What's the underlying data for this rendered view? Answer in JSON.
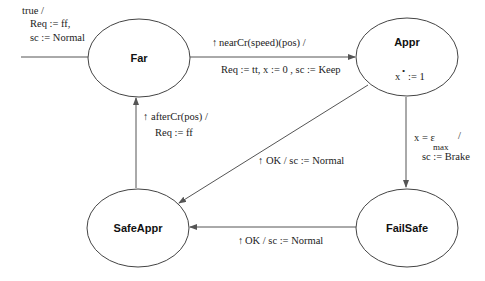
{
  "diagram": {
    "type": "state-machine",
    "states": [
      {
        "id": "far",
        "label": "Far",
        "cx": 139,
        "cy": 58,
        "rx": 51,
        "ry": 39
      },
      {
        "id": "appr",
        "label": "Appr",
        "cx": 407,
        "cy": 57,
        "rx": 51,
        "ry": 39,
        "invariant_lhs": "x",
        "invariant_dot": "•",
        "invariant_rhs": ":= 1"
      },
      {
        "id": "safeappr",
        "label": "SafeAppr",
        "cx": 138,
        "cy": 228,
        "rx": 51,
        "ry": 39
      },
      {
        "id": "failsafe",
        "label": "FailSafe",
        "cx": 407,
        "cy": 228,
        "rx": 51,
        "ry": 39
      }
    ],
    "transitions": {
      "initial": {
        "to": "far",
        "line1": "true /",
        "line2": "Req := ff,",
        "line3": "sc := Normal"
      },
      "far_to_appr": {
        "from": "far",
        "to": "appr",
        "arrow": "↑",
        "line1": "nearCr(speed)(pos)  /",
        "line2": "Req := tt, x := 0 , sc := Keep"
      },
      "appr_to_failsafe": {
        "from": "appr",
        "to": "failsafe",
        "guard_lhs": "x = ε",
        "guard_sub": "max",
        "guard_slash": "/",
        "line2": "sc := Brake"
      },
      "appr_to_safeappr": {
        "from": "appr",
        "to": "safeappr",
        "arrow": "↑",
        "label": "OK / sc := Normal"
      },
      "failsafe_to_safeappr": {
        "from": "failsafe",
        "to": "safeappr",
        "arrow": "↑",
        "label": "OK / sc := Normal"
      },
      "safeappr_to_far": {
        "from": "safeappr",
        "to": "far",
        "arrow": "↑",
        "line1": "afterCr(pos)  /",
        "line2": "Req := ff"
      }
    }
  }
}
